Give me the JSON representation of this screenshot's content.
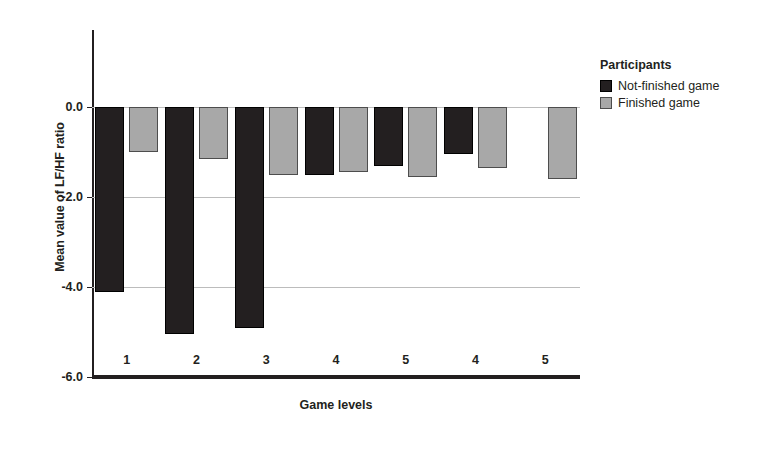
{
  "chart_data": {
    "type": "bar",
    "title": "",
    "xlabel": "Game levels",
    "ylabel": "Mean value of LF/HF ratio",
    "categories": [
      "1",
      "2",
      "3",
      "4",
      "5",
      "4",
      "5"
    ],
    "ylim": [
      -6.0,
      0.0
    ],
    "yticks": [
      "0.0",
      "-2.0",
      "-4.0",
      "-6.0"
    ],
    "ytick_values": [
      0.0,
      -2.0,
      -4.0,
      -6.0
    ],
    "grid": true,
    "orientation": "vertical",
    "legend_position": "right",
    "series": [
      {
        "name": "Not-finished game",
        "color": "#231f20",
        "values": [
          -4.1,
          -5.05,
          -4.9,
          -1.5,
          -1.3,
          -1.05,
          null
        ]
      },
      {
        "name": "Finished game",
        "color": "#a8a8a8",
        "values": [
          -1.0,
          -1.15,
          -1.5,
          -1.45,
          -1.55,
          -1.35,
          -1.6
        ]
      }
    ]
  },
  "legend": {
    "title": "Participants",
    "entries": [
      {
        "label": "Not-finished game",
        "swatch": "dark"
      },
      {
        "label": "Finished game",
        "swatch": "light"
      }
    ]
  }
}
